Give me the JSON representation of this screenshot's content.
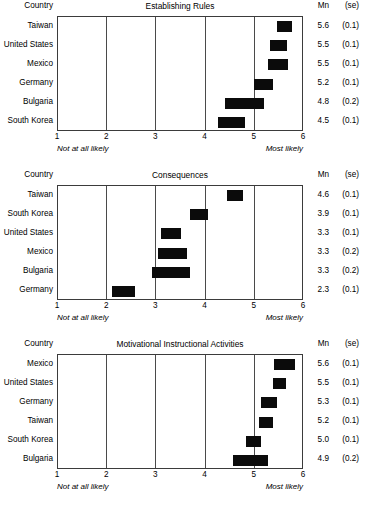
{
  "headers": {
    "country": "Country",
    "mn": "Mn",
    "se": "(se)"
  },
  "axis": {
    "ticks": [
      "1",
      "2",
      "3",
      "4",
      "5",
      "6"
    ],
    "low_anchor": "Not at all likely",
    "high_anchor": "Most likely",
    "min": 1,
    "max": 6
  },
  "colors": {
    "bar": "#0b0b0b",
    "grid": "#4a4a4a",
    "frame": "#3b3b3b",
    "text": "#000000",
    "background": "#ffffff"
  },
  "chart_data": [
    {
      "type": "bar",
      "title": "Establishing Rules",
      "xlabel": "",
      "ylabel": "Country",
      "xlim": [
        1,
        6
      ],
      "grid": true,
      "legend": "none",
      "xticks": [
        1,
        2,
        3,
        4,
        5,
        6
      ],
      "anchors": {
        "1": "Not at all likely",
        "6": "Most likely"
      },
      "categories": [
        "Taiwan",
        "United States",
        "Mexico",
        "Germany",
        "Bulgaria",
        "South Korea"
      ],
      "values": [
        5.6,
        5.5,
        5.5,
        5.2,
        4.8,
        4.5
      ],
      "se": [
        0.1,
        0.1,
        0.1,
        0.1,
        0.2,
        0.1
      ],
      "rows": [
        {
          "country": "Taiwan",
          "mean": "5.6",
          "se": "(0.1)",
          "ci_low": 5.45,
          "ci_high": 5.75
        },
        {
          "country": "United States",
          "mean": "5.5",
          "se": "(0.1)",
          "ci_low": 5.3,
          "ci_high": 5.65
        },
        {
          "country": "Mexico",
          "mean": "5.5",
          "se": "(0.1)",
          "ci_low": 5.26,
          "ci_high": 5.68
        },
        {
          "country": "Germany",
          "mean": "5.2",
          "se": "(0.1)",
          "ci_low": 4.98,
          "ci_high": 5.38
        },
        {
          "country": "Bulgaria",
          "mean": "4.8",
          "se": "(0.2)",
          "ci_low": 4.4,
          "ci_high": 5.18
        },
        {
          "country": "South Korea",
          "mean": "4.5",
          "se": "(0.1)",
          "ci_low": 4.26,
          "ci_high": 4.8
        }
      ]
    },
    {
      "type": "bar",
      "title": "Consequences",
      "xlabel": "",
      "ylabel": "Country",
      "xlim": [
        1,
        6
      ],
      "grid": true,
      "legend": "none",
      "xticks": [
        1,
        2,
        3,
        4,
        5,
        6
      ],
      "anchors": {
        "1": "Not at all likely",
        "6": "Most likely"
      },
      "categories": [
        "Taiwan",
        "South Korea",
        "United States",
        "Mexico",
        "Bulgaria",
        "Germany"
      ],
      "values": [
        4.6,
        3.9,
        3.3,
        3.3,
        3.3,
        2.3
      ],
      "se": [
        0.1,
        0.1,
        0.1,
        0.2,
        0.2,
        0.1
      ],
      "rows": [
        {
          "country": "Taiwan",
          "mean": "4.6",
          "se": "(0.1)",
          "ci_low": 4.44,
          "ci_high": 4.76
        },
        {
          "country": "South Korea",
          "mean": "3.9",
          "se": "(0.1)",
          "ci_low": 3.68,
          "ci_high": 4.04
        },
        {
          "country": "United States",
          "mean": "3.3",
          "se": "(0.1)",
          "ci_low": 3.1,
          "ci_high": 3.5
        },
        {
          "country": "Mexico",
          "mean": "3.3",
          "se": "(0.2)",
          "ci_low": 3.03,
          "ci_high": 3.62
        },
        {
          "country": "Bulgaria",
          "mean": "3.3",
          "se": "(0.2)",
          "ci_low": 2.92,
          "ci_high": 3.68
        },
        {
          "country": "Germany",
          "mean": "2.3",
          "se": "(0.1)",
          "ci_low": 2.1,
          "ci_high": 2.56
        }
      ]
    },
    {
      "type": "bar",
      "title": "Motivational Instructional Activities",
      "xlabel": "",
      "ylabel": "Country",
      "xlim": [
        1,
        6
      ],
      "grid": true,
      "legend": "none",
      "xticks": [
        1,
        2,
        3,
        4,
        5,
        6
      ],
      "anchors": {
        "1": "Not at all likely",
        "6": "Most likely"
      },
      "categories": [
        "Mexico",
        "United States",
        "Germany",
        "Taiwan",
        "South Korea",
        "Bulgaria"
      ],
      "values": [
        5.6,
        5.5,
        5.3,
        5.2,
        5.0,
        4.9
      ],
      "se": [
        0.1,
        0.1,
        0.1,
        0.1,
        0.1,
        0.2
      ],
      "rows": [
        {
          "country": "Mexico",
          "mean": "5.6",
          "se": "(0.1)",
          "ci_low": 5.4,
          "ci_high": 5.82
        },
        {
          "country": "United States",
          "mean": "5.5",
          "se": "(0.1)",
          "ci_low": 5.38,
          "ci_high": 5.64
        },
        {
          "country": "Germany",
          "mean": "5.3",
          "se": "(0.1)",
          "ci_low": 5.13,
          "ci_high": 5.45
        },
        {
          "country": "Taiwan",
          "mean": "5.2",
          "se": "(0.1)",
          "ci_low": 5.08,
          "ci_high": 5.38
        },
        {
          "country": "South Korea",
          "mean": "5.0",
          "se": "(0.1)",
          "ci_low": 4.82,
          "ci_high": 5.13
        },
        {
          "country": "Bulgaria",
          "mean": "4.9",
          "se": "(0.2)",
          "ci_low": 4.56,
          "ci_high": 5.26
        }
      ]
    }
  ]
}
